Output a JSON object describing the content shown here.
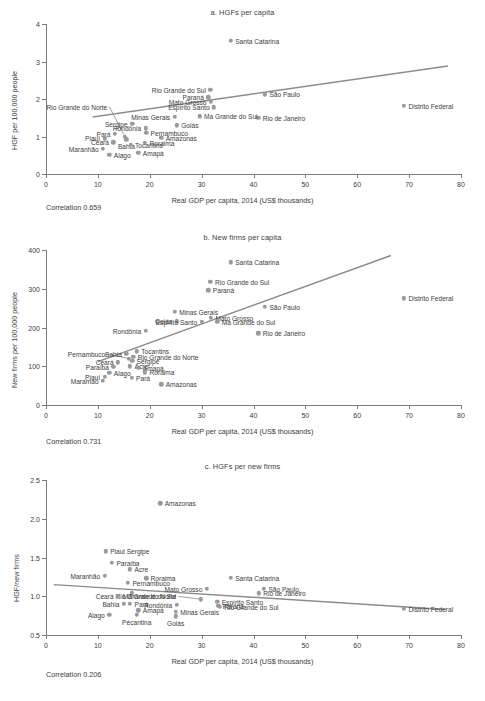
{
  "figure": {
    "x_axis_title": "Real GDP per capita, 2014 (US$ thousands)",
    "x_ticks": [
      "0",
      "10",
      "20",
      "30",
      "40",
      "50",
      "60",
      "70",
      "80"
    ],
    "marker_color": "#9a9a9a",
    "trend_color": "#8c8c8c",
    "text_color": "#3c3c3c"
  },
  "chart_data": [
    {
      "type": "scatter",
      "panel": "a",
      "title": "a. HGFs per capita",
      "xlabel": "Real GDP per capita, 2014 (US$ thousands)",
      "ylabel": "HGF per 100,000 people",
      "xlim": [
        0,
        80
      ],
      "ylim": [
        0,
        4
      ],
      "xticks": [
        0,
        10,
        20,
        30,
        40,
        50,
        60,
        70,
        80
      ],
      "yticks": [
        0,
        1,
        2,
        3,
        4
      ],
      "ytick_labels": [
        "0",
        "1",
        "2",
        "3",
        "4"
      ],
      "grid": false,
      "legend": "none",
      "annotation": "Correlation 0.659",
      "correlation": 0.659,
      "trendline": {
        "x0": 9.0,
        "y0": 1.52,
        "x1": 77.5,
        "y1": 2.88
      },
      "points": [
        {
          "label": "Santa Catarina",
          "x": 35.6,
          "y": 3.55,
          "side": "right"
        },
        {
          "label": "Rio Grande do Sul",
          "x": 31.7,
          "y": 2.24,
          "side": "left"
        },
        {
          "label": "Paraná",
          "x": 31.3,
          "y": 2.05,
          "side": "left"
        },
        {
          "label": "São Paulo",
          "x": 42.2,
          "y": 2.13,
          "side": "right"
        },
        {
          "label": "Mato Grosso",
          "x": 31.8,
          "y": 1.93,
          "side": "left"
        },
        {
          "label": "Espírito Santo",
          "x": 32.4,
          "y": 1.78,
          "side": "left"
        },
        {
          "label": "Distrito Federal",
          "x": 69.0,
          "y": 1.82,
          "side": "right"
        },
        {
          "label": "Rio de Janeiro",
          "x": 40.9,
          "y": 1.5,
          "side": "right"
        },
        {
          "label": "Minas Gerais",
          "x": 24.8,
          "y": 1.52,
          "side": "left"
        },
        {
          "label": "Ma Grande do Sul",
          "x": 29.6,
          "y": 1.54,
          "side": "right"
        },
        {
          "label": "Goiás",
          "x": 25.2,
          "y": 1.3,
          "side": "right"
        },
        {
          "label": "Sergipe",
          "x": 16.6,
          "y": 1.34,
          "side": "left"
        },
        {
          "label": "Rondônia",
          "x": 19.2,
          "y": 1.22,
          "side": "left"
        },
        {
          "label": "Pernambuco",
          "x": 19.3,
          "y": 1.1,
          "side": "right"
        },
        {
          "label": "Pará",
          "x": 13.3,
          "y": 1.08,
          "side": "left"
        },
        {
          "label": "Piauí",
          "x": 11.3,
          "y": 0.95,
          "side": "left"
        },
        {
          "label": "Bahia",
          "x": 15.5,
          "y": 0.93,
          "side": "center"
        },
        {
          "label": "Amazonas",
          "x": 22.2,
          "y": 0.97,
          "side": "right"
        },
        {
          "label": "Ceará",
          "x": 13.0,
          "y": 0.85,
          "side": "left"
        },
        {
          "label": "Roraima",
          "x": 19.1,
          "y": 0.84,
          "side": "right"
        },
        {
          "label": "Tocantins",
          "x": 16.3,
          "y": 0.78,
          "side": "right"
        },
        {
          "label": "Maranhão",
          "x": 11.0,
          "y": 0.68,
          "side": "left"
        },
        {
          "label": "Alago",
          "x": 12.2,
          "y": 0.52,
          "side": "right"
        },
        {
          "label": "Amapá",
          "x": 17.8,
          "y": 0.57,
          "side": "right"
        },
        {
          "label": "Rio Grande do Norte",
          "x": 15.2,
          "y": 1.0,
          "side": "leader"
        }
      ],
      "leader": {
        "x0": 12.2,
        "y0": 1.8,
        "x1": 15.0,
        "y1": 1.05
      }
    },
    {
      "type": "scatter",
      "panel": "b",
      "title": "b. New firms per capita",
      "xlabel": "Real GDP per capita, 2014 (US$ thousands)",
      "ylabel": "New firms per 100,000 people",
      "xlim": [
        0,
        80
      ],
      "ylim": [
        0,
        400
      ],
      "xticks": [
        0,
        10,
        20,
        30,
        40,
        50,
        60,
        70,
        80
      ],
      "yticks": [
        0,
        100,
        200,
        300,
        400
      ],
      "ytick_labels": [
        "0",
        "100",
        "200",
        "300",
        "400"
      ],
      "grid": false,
      "legend": "none",
      "annotation": "Correlation 0.731",
      "correlation": 0.731,
      "trendline": {
        "x0": 10.0,
        "y0": 112,
        "x1": 66.5,
        "y1": 386
      },
      "points": [
        {
          "label": "Santa Catarina",
          "x": 35.6,
          "y": 368,
          "side": "right"
        },
        {
          "label": "Rio Grande do Sul",
          "x": 31.7,
          "y": 318,
          "side": "right"
        },
        {
          "label": "Paraná",
          "x": 31.3,
          "y": 296,
          "side": "right"
        },
        {
          "label": "Distrito Federal",
          "x": 69.0,
          "y": 275,
          "side": "right"
        },
        {
          "label": "São Paulo",
          "x": 42.2,
          "y": 253,
          "side": "right"
        },
        {
          "label": "Minas Gerais",
          "x": 24.8,
          "y": 241,
          "side": "right"
        },
        {
          "label": "Mato Grosso",
          "x": 31.8,
          "y": 225,
          "side": "right"
        },
        {
          "label": "Ma Grande do Sul",
          "x": 33.0,
          "y": 214,
          "side": "right"
        },
        {
          "label": "Goiás",
          "x": 25.2,
          "y": 216,
          "side": "left"
        },
        {
          "label": "Espírito Santo",
          "x": 30.0,
          "y": 214,
          "side": "left"
        },
        {
          "label": "Rio de Janeiro",
          "x": 40.9,
          "y": 185,
          "side": "right"
        },
        {
          "label": "Rondônia",
          "x": 19.2,
          "y": 191,
          "side": "left"
        },
        {
          "label": "Tocantins",
          "x": 17.5,
          "y": 139,
          "side": "right"
        },
        {
          "label": "Bahia",
          "x": 15.5,
          "y": 132,
          "side": "left"
        },
        {
          "label": "Rio Grande do Norte",
          "x": 16.8,
          "y": 124,
          "side": "right"
        },
        {
          "label": "Sergipe",
          "x": 16.6,
          "y": 114,
          "side": "right"
        },
        {
          "label": "Ceará",
          "x": 13.9,
          "y": 110,
          "side": "left"
        },
        {
          "label": "Acre",
          "x": 16.2,
          "y": 100,
          "side": "right"
        },
        {
          "label": "Amapá",
          "x": 17.8,
          "y": 96,
          "side": "right"
        },
        {
          "label": "Paraíba",
          "x": 13.0,
          "y": 99,
          "side": "left"
        },
        {
          "label": "Roraima",
          "x": 19.1,
          "y": 84,
          "side": "right"
        },
        {
          "label": "Alago",
          "x": 12.2,
          "y": 83,
          "side": "right"
        },
        {
          "label": "Piauí",
          "x": 11.3,
          "y": 72,
          "side": "left"
        },
        {
          "label": "Pará",
          "x": 16.5,
          "y": 70,
          "side": "right"
        },
        {
          "label": "Maramao",
          "x": 11.0,
          "y": 62,
          "side": "left"
        },
        {
          "label": "Amazonas",
          "x": 22.2,
          "y": 53,
          "side": "right"
        },
        {
          "label": "Pernambuco",
          "x": 16.0,
          "y": 120,
          "side": "leader"
        }
      ],
      "leader": {
        "x0": 11.8,
        "y0": 131,
        "x1": 15.6,
        "y1": 121
      }
    },
    {
      "type": "scatter",
      "panel": "c",
      "title": "c. HGFs per new firms",
      "xlabel": "Real GDP per capita, 2014 (US$ thousands)",
      "ylabel": "HGF/new firms",
      "xlim": [
        0,
        80
      ],
      "ylim": [
        0.5,
        2.5
      ],
      "xticks": [
        0,
        10,
        20,
        30,
        40,
        50,
        60,
        70,
        80
      ],
      "yticks": [
        0.5,
        1.0,
        1.5,
        2.0,
        2.5
      ],
      "ytick_labels": [
        "0.5",
        "1.0",
        "1.5",
        "2.0",
        "2.5"
      ],
      "grid": false,
      "legend": "none",
      "annotation": "Correlation 0.206",
      "correlation": 0.206,
      "trendline": {
        "x0": 1.5,
        "y0": 1.15,
        "x1": 77.0,
        "y1": 0.83
      },
      "points": [
        {
          "label": "Amazonas",
          "x": 22.0,
          "y": 2.2,
          "side": "right"
        },
        {
          "label": "Piaul Sergipe",
          "x": 11.5,
          "y": 1.58,
          "side": "right"
        },
        {
          "label": "Paraíba",
          "x": 12.7,
          "y": 1.43,
          "side": "right"
        },
        {
          "label": "Acre",
          "x": 16.2,
          "y": 1.35,
          "side": "right"
        },
        {
          "label": "Maranhão",
          "x": 11.3,
          "y": 1.26,
          "side": "left"
        },
        {
          "label": "Roraima",
          "x": 19.3,
          "y": 1.23,
          "side": "right"
        },
        {
          "label": "Santa Catarina",
          "x": 35.6,
          "y": 1.24,
          "side": "right"
        },
        {
          "label": "Pernambuco",
          "x": 15.8,
          "y": 1.17,
          "side": "right"
        },
        {
          "label": "Mato Grosso",
          "x": 31.0,
          "y": 1.1,
          "side": "left"
        },
        {
          "label": "São Paulo",
          "x": 42.0,
          "y": 1.1,
          "side": "right"
        },
        {
          "label": "Rio de Janeiro",
          "x": 41.0,
          "y": 1.04,
          "side": "right"
        },
        {
          "label": "Rio Grande do Norte",
          "x": 16.5,
          "y": 1.04,
          "side": "leader"
        },
        {
          "label": "Ceará",
          "x": 13.9,
          "y": 1.0,
          "side": "left"
        },
        {
          "label": "Ma Grande do Sul",
          "x": 29.8,
          "y": 0.96,
          "side": "leader"
        },
        {
          "label": "Espírito Santo",
          "x": 33.0,
          "y": 0.93,
          "side": "right"
        },
        {
          "label": "Bahia",
          "x": 15.0,
          "y": 0.9,
          "side": "left"
        },
        {
          "label": "Pará",
          "x": 16.2,
          "y": 0.9,
          "side": "right"
        },
        {
          "label": "Rondônia",
          "x": 25.2,
          "y": 0.89,
          "side": "left"
        },
        {
          "label": "Paraná",
          "x": 33.2,
          "y": 0.88,
          "side": "right"
        },
        {
          "label": "Rio Grande do Sul",
          "x": 33.5,
          "y": 0.86,
          "side": "right"
        },
        {
          "label": "Distrito Federal",
          "x": 69.0,
          "y": 0.84,
          "side": "right"
        },
        {
          "label": "Amapá",
          "x": 17.8,
          "y": 0.82,
          "side": "right"
        },
        {
          "label": "Minas Gerais",
          "x": 25.0,
          "y": 0.8,
          "side": "right"
        },
        {
          "label": "Goiás",
          "x": 25.0,
          "y": 0.74,
          "side": "center"
        },
        {
          "label": "Pécantina",
          "x": 17.5,
          "y": 0.76,
          "side": "center"
        },
        {
          "label": "Alago",
          "x": 12.2,
          "y": 0.76,
          "side": "left"
        }
      ],
      "leader": {
        "x0": 25.5,
        "y0": 1.0,
        "x1": 30.0,
        "y1": 0.96
      }
    }
  ]
}
